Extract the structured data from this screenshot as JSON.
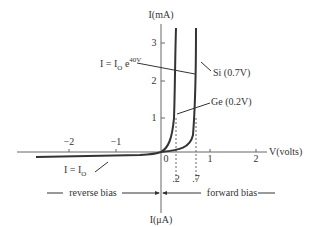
{
  "diagram": {
    "y_axis_label_top": "I(mA)",
    "y_axis_label_bottom": "I(μA)",
    "x_axis_label": "V(volts)",
    "x_ticks": [
      {
        "label": "−2",
        "value": -2
      },
      {
        "label": "−1",
        "value": -1
      },
      {
        "label": "0",
        "value": 0
      },
      {
        "label": "1",
        "value": 1
      },
      {
        "label": "2",
        "value": 2
      }
    ],
    "y_ticks": [
      {
        "label": "1",
        "value": 1
      },
      {
        "label": "2",
        "value": 2
      },
      {
        "label": "3",
        "value": 3
      }
    ],
    "threshold_labels": [
      {
        "label": ".2",
        "value": 0.2
      },
      {
        "label": ".7",
        "value": 0.7
      }
    ],
    "annotations": {
      "equation_main": "I = I",
      "equation_sub": "O",
      "equation_e": " e",
      "equation_exp": "40V",
      "si_label": "Si (0.7V)",
      "ge_label": "Ge (0.2V)",
      "saturation_main": "I = I",
      "saturation_sub": "O"
    },
    "bias_labels": {
      "reverse": "reverse bias",
      "forward": "forward bias"
    },
    "colors": {
      "line": "#333333",
      "axis": "#555555"
    }
  }
}
